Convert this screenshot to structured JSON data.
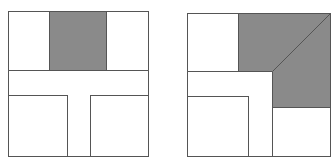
{
  "colors": {
    "background": "#ffffff",
    "stroke": "#555555",
    "fill_shaded": "#8a8a8a",
    "fill_plain": "#ffffff"
  },
  "figures": [
    {
      "id": "left",
      "description": "Square divided into regions: shaded top-center rectangle, horizontal band, T-shaped stem, two lower boxes",
      "outer": {
        "x": 8,
        "y": 11,
        "w": 140,
        "h": 145
      },
      "shaded_region": {
        "x": 49,
        "y": 11,
        "w": 57,
        "h": 59
      }
    },
    {
      "id": "right",
      "description": "Square divided into regions: shaded L-shaped region with diagonal edge in the top-right, band, stem and lower boxes",
      "outer": {
        "x": 187,
        "y": 13,
        "w": 143,
        "h": 143
      }
    }
  ]
}
